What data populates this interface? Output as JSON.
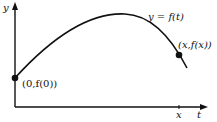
{
  "diagram": {
    "axes": {
      "y_label": "y",
      "x_label": "t"
    },
    "curve_label": "y = f(t)",
    "points": [
      {
        "label": "(0,f(0))",
        "px": [
          15,
          78
        ]
      },
      {
        "label": "(x,f(x))",
        "px": [
          179,
          55
        ]
      }
    ],
    "tick_label": "x",
    "colors": {
      "stroke": "#111111",
      "background": "#ffffff"
    }
  }
}
